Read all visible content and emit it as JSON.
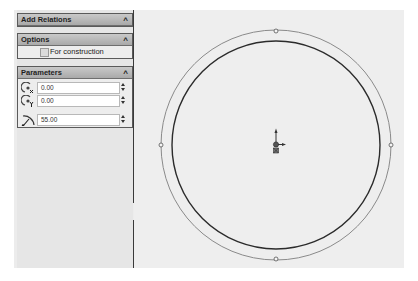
{
  "property_manager": {
    "add_relations": {
      "title": "Add Relations",
      "collapse_icon": "double-chevron-up"
    },
    "options": {
      "title": "Options",
      "collapse_icon": "double-chevron-up",
      "for_construction": {
        "label": "For construction",
        "checked": false
      }
    },
    "parameters": {
      "title": "Parameters",
      "collapse_icon": "double-chevron-up",
      "center_x": {
        "icon": "center-x-icon",
        "value": "0.00"
      },
      "center_y": {
        "icon": "center-y-icon",
        "value": "0.00"
      },
      "radius": {
        "icon": "radius-icon",
        "value": "55.00"
      }
    }
  },
  "graphics": {
    "outer_circle": {
      "cx": 276,
      "cy": 145,
      "r": 115,
      "color": "#8a8a8a",
      "state": "preview"
    },
    "inner_circle": {
      "cx": 276,
      "cy": 145,
      "r": 104,
      "color": "#2b2b2b"
    },
    "origin_icon": "sketch-origin-icon",
    "quadrant_points": 4
  },
  "colors": {
    "panel_bg": "#e6e6e6",
    "header_bg": "#b5b5b5",
    "canvas_bg": "#eeeeee"
  }
}
